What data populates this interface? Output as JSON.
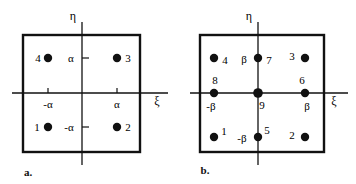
{
  "figure": {
    "background": "#ffffff",
    "stroke": "#111111",
    "dot_color": "#111111",
    "width": 356,
    "height": 184
  },
  "panels": [
    {
      "id": "a",
      "caption": "a.",
      "caption_pos": {
        "x": 28,
        "y": 172
      },
      "box": {
        "x": 23,
        "y": 35,
        "w": 117,
        "h": 117
      },
      "origin": {
        "x": 82,
        "y": 93
      },
      "axes": {
        "eta_label": "η",
        "eta_label_pos": {
          "x": 73,
          "y": 16
        },
        "xi_label": "ξ",
        "xi_label_pos": {
          "x": 157,
          "y": 101
        },
        "vertical": {
          "x": 82,
          "y1": 22,
          "y2": 165
        },
        "horizontal": {
          "y": 93,
          "x1": 12,
          "x2": 168
        }
      },
      "ticks": [
        {
          "name": "tick-neg-alpha-x",
          "label": "-α",
          "x": 48,
          "y": 93,
          "orient": "vertical",
          "label_pos": {
            "x": 48,
            "y": 104
          }
        },
        {
          "name": "tick-pos-alpha-x",
          "label": "α",
          "x": 117,
          "y": 93,
          "orient": "vertical",
          "label_pos": {
            "x": 117,
            "y": 104
          }
        },
        {
          "name": "tick-pos-alpha-y",
          "label": "α",
          "x": 82,
          "y": 58,
          "orient": "horizontal",
          "label_pos": {
            "x": 71,
            "y": 58
          }
        },
        {
          "name": "tick-neg-alpha-y",
          "label": "-α",
          "x": 82,
          "y": 127,
          "orient": "horizontal",
          "label_pos": {
            "x": 69,
            "y": 127
          }
        }
      ],
      "nodes": [
        {
          "id": "4",
          "label": "4",
          "x": 48,
          "y": 58,
          "r": 4.2,
          "label_pos": {
            "x": 38,
            "y": 58
          }
        },
        {
          "id": "3",
          "label": "3",
          "x": 117,
          "y": 58,
          "r": 4.2,
          "label_pos": {
            "x": 128,
            "y": 58
          }
        },
        {
          "id": "1",
          "label": "1",
          "x": 48,
          "y": 127,
          "r": 4.2,
          "label_pos": {
            "x": 37,
            "y": 127
          }
        },
        {
          "id": "2",
          "label": "2",
          "x": 117,
          "y": 127,
          "r": 4.2,
          "label_pos": {
            "x": 128,
            "y": 127
          }
        }
      ]
    },
    {
      "id": "b",
      "caption": "b.",
      "caption_pos": {
        "x": 205,
        "y": 170
      },
      "box": {
        "x": 200,
        "y": 35,
        "w": 124,
        "h": 117
      },
      "origin": {
        "x": 258,
        "y": 93
      },
      "axes": {
        "eta_label": "η",
        "eta_label_pos": {
          "x": 249,
          "y": 16
        },
        "xi_label": "ξ",
        "xi_label_pos": {
          "x": 334,
          "y": 101
        },
        "vertical": {
          "x": 258,
          "y1": 22,
          "y2": 165
        },
        "horizontal": {
          "y": 93,
          "x1": 190,
          "x2": 348
        }
      },
      "ticks": [],
      "nodes": [
        {
          "id": "4",
          "label": "4",
          "x": 214,
          "y": 58,
          "r": 4.2,
          "label_pos": {
            "x": 225,
            "y": 60
          }
        },
        {
          "id": "7",
          "label": "7",
          "x": 258,
          "y": 58,
          "r": 4.2,
          "label_pos": {
            "x": 269,
            "y": 60
          }
        },
        {
          "id": "3",
          "label": "3",
          "x": 305,
          "y": 58,
          "r": 4.2,
          "label_pos": {
            "x": 292,
            "y": 56
          }
        },
        {
          "id": "8",
          "label": "8",
          "x": 214,
          "y": 93,
          "r": 4.2,
          "label_pos": {
            "x": 215,
            "y": 80
          }
        },
        {
          "id": "9",
          "label": "9",
          "x": 258,
          "y": 93,
          "r": 4.8,
          "label_pos": {
            "x": 262,
            "y": 105
          }
        },
        {
          "id": "6",
          "label": "6",
          "x": 305,
          "y": 93,
          "r": 4.2,
          "label_pos": {
            "x": 302,
            "y": 80
          }
        },
        {
          "id": "1",
          "label": "1",
          "x": 214,
          "y": 137,
          "r": 4.2,
          "label_pos": {
            "x": 224,
            "y": 131
          }
        },
        {
          "id": "5",
          "label": "5",
          "x": 258,
          "y": 137,
          "r": 4.2,
          "label_pos": {
            "x": 267,
            "y": 130
          }
        },
        {
          "id": "2",
          "label": "2",
          "x": 305,
          "y": 137,
          "r": 4.2,
          "label_pos": {
            "x": 292,
            "y": 135
          }
        }
      ],
      "value_labels": [
        {
          "name": "beta-top",
          "label": "β",
          "x": 244,
          "y": 59
        },
        {
          "name": "neg-beta-left",
          "label": "-β",
          "x": 211,
          "y": 106
        },
        {
          "name": "beta-right",
          "label": "β",
          "x": 307,
          "y": 106
        },
        {
          "name": "neg-beta-bottom",
          "label": "-β",
          "x": 242,
          "y": 138
        }
      ]
    }
  ]
}
